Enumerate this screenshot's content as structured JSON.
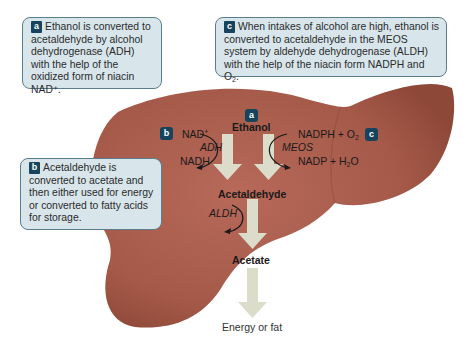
{
  "boxes": {
    "a": {
      "badge": "a",
      "text": "Ethanol is converted to acetaldehyde by alcohol dehydrogenase (ADH) with the help of the oxidized form of niacin NAD⁺."
    },
    "b": {
      "badge": "b",
      "text": "Acetaldehyde is converted to acetate and then either used for energy or converted to fatty acids for storage."
    },
    "c": {
      "badge": "c",
      "text_main": "When intakes of alcohol are high, ethanol is converted to acetaldehyde in the MEOS system by aldehyde dehydrogenase (ALDH) with the help of the niacin form NADPH and O",
      "text_sub": "2",
      "text_end": "."
    }
  },
  "markers": {
    "a": "a",
    "b": "b",
    "c": "c"
  },
  "pathway": {
    "ethanol": "Ethanol",
    "acetaldehyde": "Acetaldehyde",
    "acetate": "Acetate",
    "output": "Energy or fat",
    "adh": {
      "enzyme": "ADH",
      "input": "NAD",
      "input_sup": "+",
      "output": "NADH"
    },
    "meos": {
      "enzyme": "MEOS",
      "input": "NADPH + O",
      "input_sub": "2",
      "output_a": "NADP + H",
      "output_sub": "2",
      "output_b": "O"
    },
    "aldh": {
      "enzyme": "ALDH"
    }
  },
  "colors": {
    "liver": "#a85a48",
    "box_bg": "#d8e6ec",
    "box_border": "#5a7e8e",
    "badge": "#17445c",
    "arrow": "#dcdccb"
  }
}
